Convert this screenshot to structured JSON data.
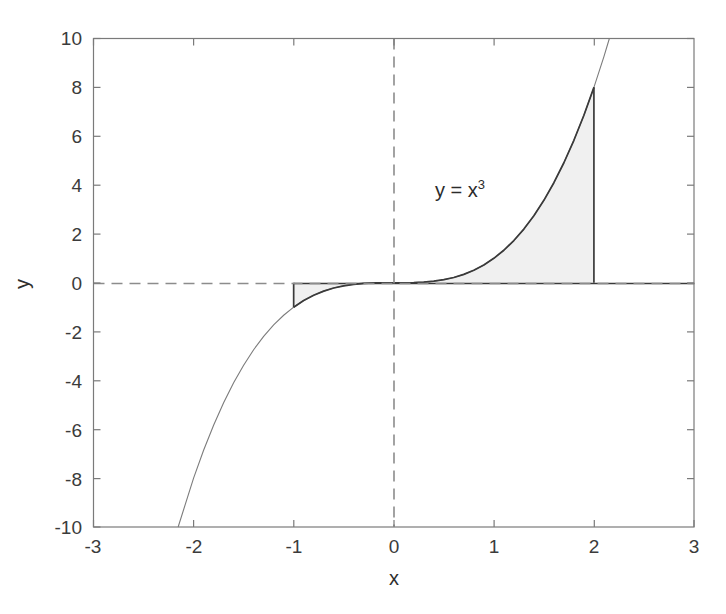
{
  "figure": {
    "background_color": "#ffffff",
    "axes_color": "#7a7a7a",
    "curve_color": "#6d6d6d",
    "curve_emphasis_color": "#3a3a3a",
    "fill_color": "#f0f0f0",
    "fill_edge_color": "#4a4a4a",
    "reference_line_color": "#8c8c8c",
    "text_color": "#3b3b3b"
  },
  "axis": {
    "xlabel": "x",
    "ylabel": "y",
    "xticks": [
      "-3",
      "-2",
      "-1",
      "0",
      "1",
      "2",
      "3"
    ],
    "yticks": [
      "10",
      "8",
      "6",
      "4",
      "2",
      "0",
      "-2",
      "-4",
      "-6",
      "-8",
      "-10"
    ]
  },
  "annotations": {
    "curve_equation_base": "y = x",
    "curve_equation_exponent": "3"
  },
  "chart_data": {
    "type": "line",
    "title": "",
    "xlabel": "x",
    "ylabel": "y",
    "xlim": [
      -3,
      3
    ],
    "ylim": [
      -10,
      10
    ],
    "xticks": [
      -3,
      -2,
      -1,
      0,
      1,
      2,
      3
    ],
    "yticks": [
      10,
      8,
      6,
      4,
      2,
      0,
      -2,
      -4,
      -6,
      -8,
      -10
    ],
    "grid": false,
    "legend": null,
    "annotations": [
      {
        "text": "y = x^3",
        "x": 0.65,
        "y": 4.1
      }
    ],
    "reference_lines": [
      {
        "orientation": "horizontal",
        "value": 0,
        "style": "dashed"
      },
      {
        "orientation": "vertical",
        "value": 0,
        "style": "dashed"
      }
    ],
    "series": [
      {
        "name": "y = x^3",
        "equation": "y = x**3",
        "x": [
          -2.1544,
          -2.0,
          -1.9,
          -1.8,
          -1.7,
          -1.6,
          -1.5,
          -1.4,
          -1.3,
          -1.2,
          -1.1,
          -1.0,
          -0.9,
          -0.8,
          -0.7,
          -0.6,
          -0.5,
          -0.4,
          -0.3,
          -0.2,
          -0.1,
          0.0,
          0.1,
          0.2,
          0.3,
          0.4,
          0.5,
          0.6,
          0.7,
          0.8,
          0.9,
          1.0,
          1.1,
          1.2,
          1.3,
          1.4,
          1.5,
          1.6,
          1.7,
          1.8,
          1.9,
          2.0,
          2.1,
          2.1544
        ],
        "y": [
          -10.0,
          -8.0,
          -6.859,
          -5.832,
          -4.913,
          -4.096,
          -3.375,
          -2.744,
          -2.197,
          -1.728,
          -1.331,
          -1.0,
          -0.729,
          -0.512,
          -0.343,
          -0.216,
          -0.125,
          -0.064,
          -0.027,
          -0.008,
          -0.001,
          0.0,
          0.001,
          0.008,
          0.027,
          0.064,
          0.125,
          0.216,
          0.343,
          0.512,
          0.729,
          1.0,
          1.331,
          1.728,
          2.197,
          2.744,
          3.375,
          4.096,
          4.913,
          5.832,
          6.859,
          8.0,
          9.261,
          10.0
        ]
      }
    ],
    "filled_regions": [
      {
        "name": "positive-area-0-to-2",
        "x_from": 0,
        "x_to": 2,
        "baseline": 0,
        "area_value": 4.0,
        "endpoint_label": "y(2) = 8"
      },
      {
        "name": "negative-area-neg1-to-0",
        "x_from": -1,
        "x_to": 0,
        "baseline": 0,
        "area_value": -0.25,
        "endpoint_label": "y(-1) = -1"
      }
    ]
  }
}
